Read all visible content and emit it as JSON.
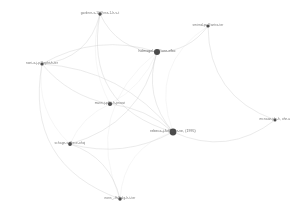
{
  "view": {
    "kind": "network-graph",
    "background_color": "#ffffff",
    "width": 299,
    "height": 215
  },
  "chart_data": {
    "type": "scatter",
    "title": "",
    "subtitle": "",
    "xlabel": "",
    "ylabel": "",
    "grid": false,
    "legend": null,
    "layout": "force-directed",
    "node_color": "#4a4a4a",
    "edge_color": "#c9c9c9",
    "label_color": "#6a6a6a",
    "node_count": 9,
    "edge_count": 22,
    "nodes": [
      {
        "id": "n1",
        "label": "gardner-s-10@ess-1-h-v-t",
        "x": 100,
        "y": 14,
        "size": 1.7,
        "role": "peripheral"
      },
      {
        "id": "n2",
        "label": "smirnd-pu@antro-ter",
        "x": 208,
        "y": 26,
        "size": 1.6,
        "role": "peripheral"
      },
      {
        "id": "n3",
        "label": "holmagel-s-@iore-efbo",
        "x": 157,
        "y": 52,
        "size": 3.0,
        "role": "hub"
      },
      {
        "id": "n4",
        "label": "noni-o-j-p@npht-h-ter",
        "x": 42,
        "y": 64,
        "size": 1.6,
        "role": "peripheral"
      },
      {
        "id": "n5",
        "label": "mann-j-p@t-h-proovi",
        "x": 110,
        "y": 104,
        "size": 2.1,
        "role": "medium"
      },
      {
        "id": "n6",
        "label": "rebeca-j-fu@d-er-ve, (1995)",
        "x": 173,
        "y": 132,
        "size": 3.4,
        "role": "hub"
      },
      {
        "id": "n7",
        "label": "mcnaan-jde-h, ohn-u",
        "x": 275,
        "y": 120,
        "size": 1.5,
        "role": "peripheral"
      },
      {
        "id": "n8",
        "label": "schagn-s-@ece-ohoj",
        "x": 70,
        "y": 144,
        "size": 1.9,
        "role": "peripheral"
      },
      {
        "id": "n9",
        "label": "nons_-fh@alg-h-t-ter",
        "x": 120,
        "y": 199,
        "size": 1.7,
        "role": "peripheral"
      }
    ],
    "edges": [
      {
        "source": "n1",
        "target": "n3",
        "curve": 0.3
      },
      {
        "source": "n1",
        "target": "n4",
        "curve": -0.35
      },
      {
        "source": "n1",
        "target": "n5",
        "curve": 0.2
      },
      {
        "source": "n1",
        "target": "n6",
        "curve": 0.45
      },
      {
        "source": "n2",
        "target": "n3",
        "curve": -0.25
      },
      {
        "source": "n2",
        "target": "n6",
        "curve": 0.4
      },
      {
        "source": "n2",
        "target": "n7",
        "curve": 0.35
      },
      {
        "source": "n3",
        "target": "n4",
        "curve": 0.22
      },
      {
        "source": "n3",
        "target": "n5",
        "curve": -0.18
      },
      {
        "source": "n3",
        "target": "n6",
        "curve": 0.28
      },
      {
        "source": "n3",
        "target": "n8",
        "curve": -0.3
      },
      {
        "source": "n3",
        "target": "n9",
        "curve": 0.38
      },
      {
        "source": "n4",
        "target": "n5",
        "curve": 0.18
      },
      {
        "source": "n4",
        "target": "n6",
        "curve": -0.22
      },
      {
        "source": "n4",
        "target": "n8",
        "curve": 0.26
      },
      {
        "source": "n4",
        "target": "n9",
        "curve": 0.42
      },
      {
        "source": "n5",
        "target": "n6",
        "curve": -0.16
      },
      {
        "source": "n5",
        "target": "n8",
        "curve": 0.2
      },
      {
        "source": "n6",
        "target": "n7",
        "curve": 0.3
      },
      {
        "source": "n6",
        "target": "n8",
        "curve": -0.2
      },
      {
        "source": "n6",
        "target": "n9",
        "curve": 0.34
      },
      {
        "source": "n8",
        "target": "n9",
        "curve": -0.28
      }
    ]
  }
}
